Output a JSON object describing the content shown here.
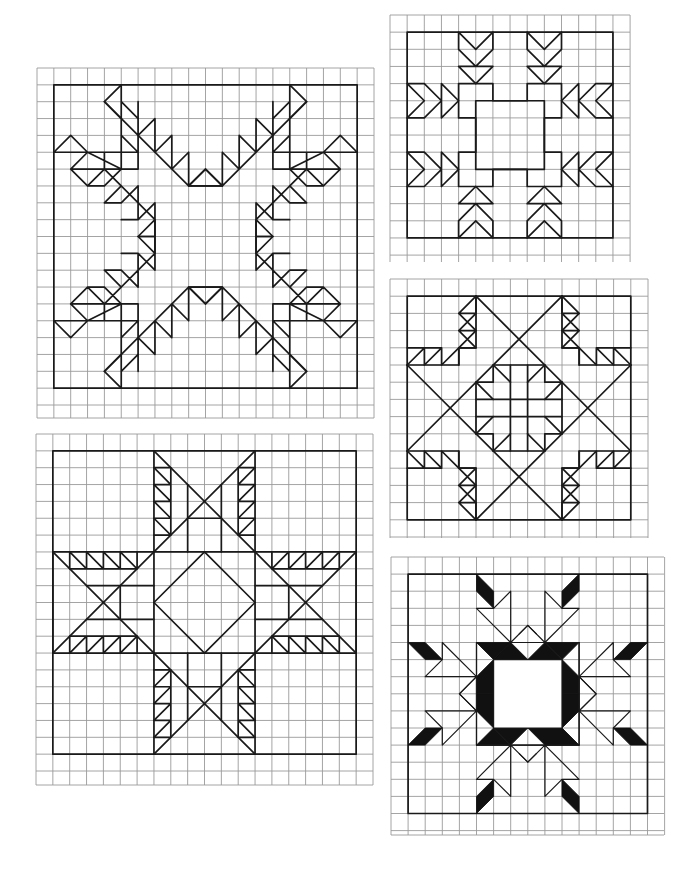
{
  "page": {
    "background": "#ffffff",
    "grid_color": "#9a9a9a",
    "line_color": "#1a1a1a",
    "fill_color": "#111111"
  },
  "blocks": [
    {
      "id": "block-1",
      "name": "feathered-x-star",
      "position": "top-left",
      "grid": {
        "x": 37,
        "y": 68,
        "cols": 20,
        "rows": 21,
        "cell": 16.85
      },
      "block_cells": 18
    },
    {
      "id": "block-2",
      "name": "arrow-square",
      "position": "top-right",
      "grid": {
        "x": 390,
        "y": 15,
        "cols": 14,
        "rows": 14,
        "cell": 17.15
      },
      "block_cells": 12
    },
    {
      "id": "block-3",
      "name": "feathered-star-cross",
      "position": "middle-right",
      "grid": {
        "x": 390,
        "y": 279,
        "cols": 15,
        "rows": 15,
        "cell": 17.2
      },
      "block_cells": 13
    },
    {
      "id": "block-4",
      "name": "feathered-eight-point-star",
      "position": "bottom-left",
      "grid": {
        "x": 36,
        "y": 434,
        "cols": 20,
        "rows": 21,
        "cell": 16.85
      },
      "block_cells": 18
    },
    {
      "id": "block-5",
      "name": "snowflake-star",
      "position": "bottom-right",
      "grid": {
        "x": 391,
        "y": 557,
        "cols": 16,
        "rows": 16,
        "cell": 17.1
      },
      "block_cells": 14
    }
  ]
}
